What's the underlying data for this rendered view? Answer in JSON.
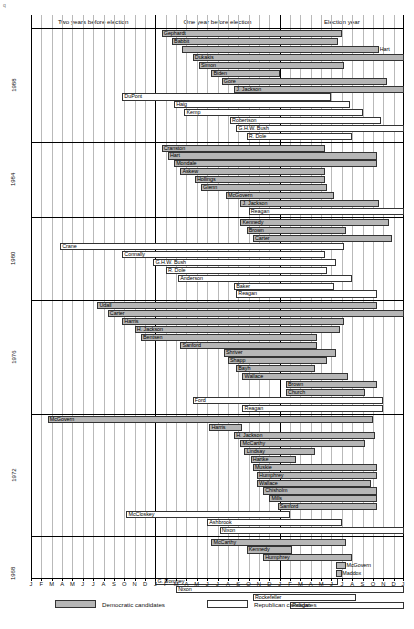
{
  "chart_data": {
    "type": "bar",
    "xlabel": "",
    "ylabel": "",
    "x_axis": {
      "months": [
        "J",
        "F",
        "M",
        "A",
        "M",
        "J",
        "J",
        "A",
        "S",
        "O",
        "N",
        "D",
        "J",
        "F",
        "M",
        "A",
        "M",
        "J",
        "J",
        "A",
        "S",
        "O",
        "N",
        "D",
        "J",
        "F",
        "M",
        "A",
        "M",
        "J",
        "J",
        "A",
        "S",
        "O",
        "N",
        "D",
        "J"
      ],
      "range_months": [
        0,
        36
      ],
      "grid": true
    },
    "period_headers": [
      {
        "label": "Two years before election",
        "start": 0,
        "end": 12
      },
      {
        "label": "One year before election",
        "start": 12,
        "end": 24
      },
      {
        "label": "Election year",
        "start": 24,
        "end": 36
      }
    ],
    "legend": {
      "position": "bottom-left",
      "entries": [
        {
          "label": "Democratic candidates",
          "party": "dem",
          "color": "#b6b6b6"
        },
        {
          "label": "Republican candidates",
          "party": "rep",
          "color": "#ffffff"
        }
      ]
    },
    "cycles": [
      {
        "year": "1988",
        "bars": [
          {
            "name": "Gephardt",
            "party": "dem",
            "start": 12.6,
            "end": 30.0
          },
          {
            "name": "Babbit",
            "party": "dem",
            "start": 13.6,
            "end": 29.6
          },
          {
            "name": "Hart",
            "party": "dem",
            "start": 14.6,
            "end": 33.6,
            "label_outside": true
          },
          {
            "name": "Dukakis",
            "party": "dem",
            "start": 15.6,
            "end": 36.0
          },
          {
            "name": "Simon",
            "party": "dem",
            "start": 16.2,
            "end": 30.2
          },
          {
            "name": "Biden",
            "party": "dem",
            "start": 17.4,
            "end": 24.0
          },
          {
            "name": "Gore",
            "party": "dem",
            "start": 18.4,
            "end": 34.4
          },
          {
            "name": "J. Jackson",
            "party": "dem",
            "start": 19.6,
            "end": 36.0
          },
          {
            "name": "DuPont",
            "party": "rep",
            "start": 8.8,
            "end": 29.0
          },
          {
            "name": "Haig",
            "party": "rep",
            "start": 13.8,
            "end": 30.8
          },
          {
            "name": "Kemp",
            "party": "rep",
            "start": 14.8,
            "end": 32.0
          },
          {
            "name": "Robertson",
            "party": "rep",
            "start": 19.2,
            "end": 33.8
          },
          {
            "name": "G.H.W. Bush",
            "party": "rep",
            "start": 19.8,
            "end": 36.0
          },
          {
            "name": "R. Dole",
            "party": "rep",
            "start": 20.8,
            "end": 31.0
          }
        ]
      },
      {
        "year": "1984",
        "bars": [
          {
            "name": "Cranston",
            "party": "dem",
            "start": 12.6,
            "end": 28.4
          },
          {
            "name": "Hart",
            "party": "dem",
            "start": 13.2,
            "end": 33.4
          },
          {
            "name": "Mondale",
            "party": "dem",
            "start": 13.8,
            "end": 33.4
          },
          {
            "name": "Askew",
            "party": "dem",
            "start": 14.4,
            "end": 28.4
          },
          {
            "name": "Hollings",
            "party": "dem",
            "start": 15.8,
            "end": 28.4
          },
          {
            "name": "Glenn",
            "party": "dem",
            "start": 16.4,
            "end": 28.6
          },
          {
            "name": "McGovern",
            "party": "dem",
            "start": 18.8,
            "end": 29.2
          },
          {
            "name": "J. Jackson",
            "party": "dem",
            "start": 20.2,
            "end": 33.6
          },
          {
            "name": "Reagan",
            "party": "rep",
            "start": 21.0,
            "end": 36.0
          }
        ]
      },
      {
        "year": "1980",
        "bars": [
          {
            "name": "Kennedy",
            "party": "dem",
            "start": 20.2,
            "end": 34.6
          },
          {
            "name": "Brown",
            "party": "dem",
            "start": 20.8,
            "end": 30.4
          },
          {
            "name": "Carter",
            "party": "dem",
            "start": 21.4,
            "end": 34.8
          },
          {
            "name": "Crane",
            "party": "rep",
            "start": 2.8,
            "end": 30.2
          },
          {
            "name": "Connally",
            "party": "rep",
            "start": 8.8,
            "end": 28.4
          },
          {
            "name": "G.H.W. Bush",
            "party": "rep",
            "start": 11.8,
            "end": 29.4
          },
          {
            "name": "R. Dole",
            "party": "rep",
            "start": 13.0,
            "end": 28.6
          },
          {
            "name": "Anderson",
            "party": "rep",
            "start": 14.2,
            "end": 31.0
          },
          {
            "name": "Baker",
            "party": "rep",
            "start": 19.6,
            "end": 29.2
          },
          {
            "name": "Reagan",
            "party": "rep",
            "start": 19.8,
            "end": 33.4
          }
        ]
      },
      {
        "year": "1976",
        "bars": [
          {
            "name": "Udall",
            "party": "dem",
            "start": 6.4,
            "end": 33.4
          },
          {
            "name": "Carter",
            "party": "dem",
            "start": 7.4,
            "end": 36.0
          },
          {
            "name": "Harris",
            "party": "dem",
            "start": 8.8,
            "end": 30.2
          },
          {
            "name": "H. Jackson",
            "party": "dem",
            "start": 10.0,
            "end": 29.8
          },
          {
            "name": "Bentsen",
            "party": "dem",
            "start": 10.6,
            "end": 27.6
          },
          {
            "name": "Sanford",
            "party": "dem",
            "start": 14.4,
            "end": 27.6
          },
          {
            "name": "Shriver",
            "party": "dem",
            "start": 18.6,
            "end": 29.4
          },
          {
            "name": "Shapp",
            "party": "dem",
            "start": 19.0,
            "end": 28.6
          },
          {
            "name": "Bayh",
            "party": "dem",
            "start": 19.8,
            "end": 27.4
          },
          {
            "name": "Wallace",
            "party": "dem",
            "start": 20.4,
            "end": 30.6
          },
          {
            "name": "Brown",
            "party": "dem",
            "start": 24.6,
            "end": 33.4
          },
          {
            "name": "Church",
            "party": "dem",
            "start": 24.6,
            "end": 32.2
          },
          {
            "name": "Ford",
            "party": "rep",
            "start": 15.6,
            "end": 34.0
          },
          {
            "name": "Reagan",
            "party": "rep",
            "start": 20.4,
            "end": 34.0
          }
        ]
      },
      {
        "year": "1972",
        "bars": [
          {
            "name": "McGovern",
            "party": "dem",
            "start": 1.6,
            "end": 33.0
          },
          {
            "name": "Harris",
            "party": "dem",
            "start": 17.2,
            "end": 20.4
          },
          {
            "name": "H. Jackson",
            "party": "dem",
            "start": 19.6,
            "end": 33.2
          },
          {
            "name": "McCarthy",
            "party": "dem",
            "start": 20.2,
            "end": 32.2
          },
          {
            "name": "Lindsay",
            "party": "dem",
            "start": 20.6,
            "end": 27.4
          },
          {
            "name": "Hartke",
            "party": "dem",
            "start": 21.2,
            "end": 25.6
          },
          {
            "name": "Muskie",
            "party": "dem",
            "start": 21.4,
            "end": 33.4
          },
          {
            "name": "Humphrey",
            "party": "dem",
            "start": 21.8,
            "end": 33.4
          },
          {
            "name": "Wallace",
            "party": "dem",
            "start": 21.8,
            "end": 32.8
          },
          {
            "name": "Chisholm",
            "party": "dem",
            "start": 22.4,
            "end": 33.4
          },
          {
            "name": "Mills",
            "party": "dem",
            "start": 23.0,
            "end": 33.4
          },
          {
            "name": "Sanford",
            "party": "dem",
            "start": 23.8,
            "end": 33.4
          },
          {
            "name": "McCloskey",
            "party": "rep",
            "start": 9.2,
            "end": 25.0
          },
          {
            "name": "Ashbrook",
            "party": "rep",
            "start": 17.0,
            "end": 30.0
          },
          {
            "name": "Nixon",
            "party": "rep",
            "start": 18.2,
            "end": 36.0
          }
        ]
      },
      {
        "year": "1968",
        "bars": [
          {
            "name": "McCarthy",
            "party": "dem",
            "start": 17.4,
            "end": 30.4
          },
          {
            "name": "Kennedy",
            "party": "dem",
            "start": 20.8,
            "end": 25.2
          },
          {
            "name": "Humphrey",
            "party": "dem",
            "start": 22.4,
            "end": 31.0
          },
          {
            "name": "McGovern",
            "party": "dem",
            "start": 29.4,
            "end": 30.4,
            "label_outside": true
          },
          {
            "name": "Maddox",
            "party": "dem",
            "start": 29.4,
            "end": 30.0,
            "label_outside": true
          },
          {
            "name": "G. Romney",
            "party": "rep",
            "start": 12.0,
            "end": 29.6
          },
          {
            "name": "Nixon",
            "party": "rep",
            "start": 14.0,
            "end": 36.0
          },
          {
            "name": "Rockefeller",
            "party": "rep",
            "start": 21.4,
            "end": 31.4
          },
          {
            "name": "Reagan",
            "party": "rep",
            "start": 25.0,
            "end": 36.0
          }
        ]
      }
    ]
  }
}
